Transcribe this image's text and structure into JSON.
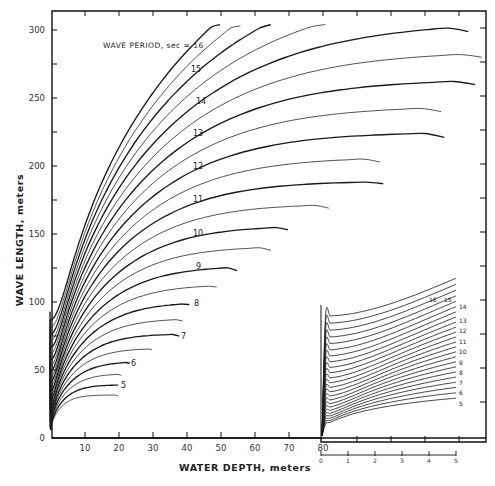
{
  "chart_data": {
    "type": "line",
    "title": "",
    "annotation": "WAVE PERIOD, sec = 16",
    "xlabel": "WATER DEPTH, meters",
    "ylabel": "WAVE LENGTH, meters",
    "xlim": [
      0,
      128
    ],
    "ylim": [
      0,
      310
    ],
    "grid": false,
    "x_ticks": [
      0,
      10,
      20,
      30,
      40,
      50,
      60,
      70,
      80
    ],
    "y_ticks": [
      0,
      50,
      100,
      150,
      200,
      250,
      300
    ],
    "y_minor_ticks": [
      25,
      75,
      125,
      175,
      225,
      275
    ],
    "x_tick_labels": [
      "10",
      "20",
      "30",
      "40",
      "50",
      "60",
      "70",
      "80"
    ],
    "y_tick_labels": [
      "0",
      "50",
      "100",
      "150",
      "200",
      "250",
      "300"
    ],
    "series_periods_sec": [
      4.5,
      5,
      5.5,
      6,
      6.5,
      7,
      7.5,
      8,
      8.5,
      9,
      9.5,
      10,
      10.5,
      11,
      11.5,
      12,
      12.5,
      13,
      13.5,
      14,
      14.5,
      15,
      15.5,
      16
    ],
    "series": [
      {
        "name": "4.5 sec",
        "period": 4.5,
        "style": "thin",
        "x": [
          0,
          2,
          5,
          10,
          20
        ],
        "y": [
          0,
          19,
          27,
          30,
          31
        ]
      },
      {
        "name": "5 sec",
        "period": 5,
        "style": "thick",
        "label": "5",
        "x": [
          0,
          2,
          5,
          10,
          20
        ],
        "y": [
          0,
          22,
          32,
          37,
          39
        ]
      },
      {
        "name": "5.5 sec",
        "period": 5.5,
        "style": "thin",
        "x": [
          0,
          2,
          5,
          10,
          21
        ],
        "y": [
          0,
          24,
          36,
          43,
          46
        ]
      },
      {
        "name": "6 sec",
        "period": 6,
        "style": "thick",
        "label": "6",
        "x": [
          0,
          2,
          5,
          10,
          23.5
        ],
        "y": [
          0,
          26,
          40,
          49,
          55
        ]
      },
      {
        "name": "6.5 sec",
        "period": 6.5,
        "style": "thin",
        "x": [
          0,
          2,
          5,
          10,
          30
        ],
        "y": [
          0,
          29,
          44,
          55,
          65
        ]
      },
      {
        "name": "7 sec",
        "period": 7,
        "style": "thick",
        "label": "7",
        "x": [
          0,
          2,
          5,
          10,
          20,
          38
        ],
        "y": [
          0,
          31,
          47,
          61,
          72,
          75
        ]
      },
      {
        "name": "7.5 sec",
        "period": 7.5,
        "style": "thin",
        "x": [
          0,
          2,
          5,
          10,
          20,
          39
        ],
        "y": [
          0,
          33,
          51,
          66,
          80,
          86
        ]
      },
      {
        "name": "8 sec",
        "period": 8,
        "style": "thick",
        "label": "8",
        "x": [
          0,
          2,
          5,
          10,
          20,
          41
        ],
        "y": [
          0,
          35,
          54,
          72,
          89,
          98
        ]
      },
      {
        "name": "8.5 sec",
        "period": 8.5,
        "style": "thin",
        "x": [
          0,
          5,
          10,
          20,
          30,
          49
        ],
        "y": [
          0,
          58,
          77,
          97,
          106,
          111
        ]
      },
      {
        "name": "9 sec",
        "period": 9,
        "style": "thick",
        "label": "9",
        "x": [
          0,
          5,
          10,
          20,
          30,
          55
        ],
        "y": [
          0,
          61,
          82,
          104,
          115,
          123
        ]
      },
      {
        "name": "9.5 sec",
        "period": 9.5,
        "style": "thin",
        "x": [
          0,
          5,
          10,
          20,
          40,
          65
        ],
        "y": [
          0,
          65,
          87,
          112,
          132,
          138
        ]
      },
      {
        "name": "10 sec",
        "period": 10,
        "style": "thick",
        "label": "10",
        "x": [
          0,
          5,
          10,
          20,
          40,
          70
        ],
        "y": [
          0,
          68,
          92,
          119,
          143,
          153
        ]
      },
      {
        "name": "10.5 sec",
        "period": 10.5,
        "style": "thin",
        "x": [
          0,
          5,
          10,
          20,
          40,
          82
        ],
        "y": [
          0,
          72,
          97,
          126,
          154,
          169
        ]
      },
      {
        "name": "11 sec",
        "period": 11,
        "style": "thick",
        "label": "11",
        "x": [
          0,
          5,
          10,
          20,
          40,
          98
        ],
        "y": [
          0,
          75,
          102,
          133,
          164,
          187
        ]
      },
      {
        "name": "11.5 sec",
        "period": 11.5,
        "style": "thin",
        "x": [
          0,
          5,
          10,
          20,
          40,
          97
        ],
        "y": [
          0,
          78,
          106,
          140,
          174,
          203
        ]
      },
      {
        "name": "12 sec",
        "period": 12,
        "style": "thick",
        "label": "12",
        "x": [
          0,
          5,
          10,
          20,
          40,
          116
        ],
        "y": [
          0,
          82,
          111,
          147,
          184,
          221
        ]
      },
      {
        "name": "12.5 sec",
        "period": 12.5,
        "style": "thin",
        "x": [
          0,
          5,
          10,
          20,
          40,
          115
        ],
        "y": [
          0,
          85,
          116,
          153,
          193,
          240
        ]
      },
      {
        "name": "13 sec",
        "period": 13,
        "style": "thick",
        "label": "13",
        "x": [
          0,
          5,
          10,
          20,
          40,
          125
        ],
        "y": [
          0,
          89,
          121,
          160,
          203,
          260
        ]
      },
      {
        "name": "13.5 sec",
        "period": 13.5,
        "style": "thin",
        "x": [
          0,
          5,
          10,
          20,
          40,
          127
        ],
        "y": [
          0,
          92,
          125,
          166,
          212,
          280
        ]
      },
      {
        "name": "14 sec",
        "period": 14,
        "style": "thick",
        "label": "14",
        "x": [
          0,
          5,
          10,
          20,
          40,
          123
        ],
        "y": [
          0,
          96,
          130,
          173,
          221,
          299
        ]
      },
      {
        "name": "14.5 sec",
        "period": 14.5,
        "style": "thin",
        "x": [
          0,
          5,
          10,
          20,
          40,
          81
        ],
        "y": [
          0,
          99,
          135,
          179,
          230,
          304
        ]
      },
      {
        "name": "15 sec",
        "period": 15,
        "style": "thick",
        "label": "15",
        "x": [
          0,
          5,
          10,
          20,
          40,
          65
        ],
        "y": [
          0,
          103,
          140,
          186,
          239,
          304
        ]
      },
      {
        "name": "15.5 sec",
        "period": 15.5,
        "style": "thin",
        "x": [
          0,
          5,
          10,
          20,
          40,
          56
        ],
        "y": [
          0,
          106,
          144,
          192,
          248,
          303
        ]
      },
      {
        "name": "16 sec",
        "period": 16,
        "style": "thick",
        "label": "16",
        "x": [
          0,
          5,
          10,
          20,
          40,
          50
        ],
        "y": [
          0,
          110,
          149,
          199,
          257,
          304
        ]
      }
    ],
    "inset": {
      "description": "Enlarged shallow-water portion (0–5 m depth) plotted at 80–120 on main scale",
      "x_ticks_main": [
        80,
        90,
        100,
        110,
        120
      ],
      "x_tick_labels_main": [
        "80",
        "90",
        "100",
        "110",
        "120"
      ],
      "x_ticks_expanded": [
        0,
        1,
        2,
        3,
        4,
        5
      ],
      "x_tick_labels_expanded": [
        "0",
        "1",
        "2",
        "3",
        "4",
        "5"
      ],
      "depth_range_m": [
        0,
        5
      ],
      "curve_labels": [
        "16",
        "15",
        "14",
        "13",
        "12",
        "11",
        "10",
        "9",
        "8",
        "7",
        "6",
        "5"
      ]
    }
  },
  "labels": {
    "annotation": "WAVE PERIOD, sec = 16",
    "xlabel": "WATER DEPTH, meters",
    "ylabel": "WAVE LENGTH, meters",
    "y_zero": "0"
  },
  "colors": {
    "line": "#1a1a1a",
    "axis": "#111111",
    "text": "#222222",
    "background": "#ffffff"
  }
}
